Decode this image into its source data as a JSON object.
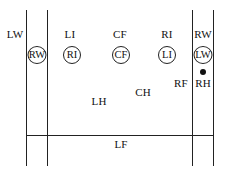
{
  "diagram": {
    "title": "",
    "labels": {
      "lw": "LW",
      "li": "LI",
      "cf_top": "CF",
      "ri": "RI",
      "rw": "RW",
      "rf": "RF",
      "rh": "RH",
      "lh": "LH",
      "ch": "CH",
      "lf": "LF"
    },
    "circled_players": {
      "rw": "RW",
      "ri": "RI",
      "cf": "CF",
      "li": "LI",
      "lw": "LW"
    },
    "markers": {
      "ball": "ball-dot"
    }
  }
}
